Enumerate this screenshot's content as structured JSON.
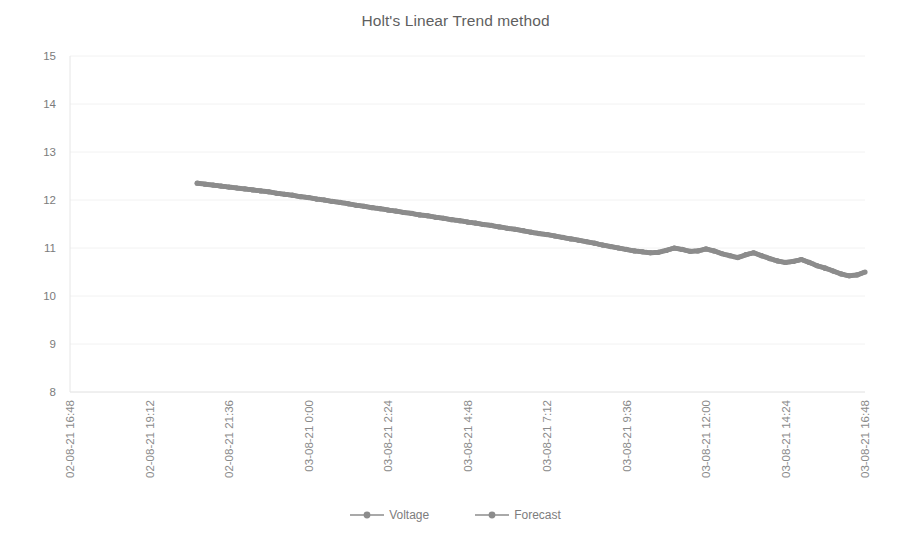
{
  "chart_data": {
    "type": "line",
    "title": "Holt's Linear Trend method",
    "xlabel": "",
    "ylabel": "",
    "ylim": [
      8,
      15
    ],
    "ytick_values": [
      8,
      9,
      10,
      11,
      12,
      13,
      14,
      15
    ],
    "ytick_labels": [
      "8",
      "9",
      "10",
      "11",
      "12",
      "13",
      "14",
      "15"
    ],
    "xtick_labels": [
      "02-08-21 16:48",
      "02-08-21 19:12",
      "02-08-21 21:36",
      "03-08-21 0:00",
      "03-08-21 2:24",
      "03-08-21 4:48",
      "03-08-21 7:12",
      "03-08-21 9:36",
      "03-08-21 12:00",
      "03-08-21 14:24",
      "03-08-21 16:48"
    ],
    "grid": true,
    "legend_position": "bottom",
    "series": [
      {
        "name": "Voltage",
        "color": "#8c8c8c",
        "marker": "circle",
        "x": [
          0.16,
          0.17,
          0.18,
          0.19,
          0.2,
          0.21,
          0.22,
          0.23,
          0.24,
          0.25,
          0.26,
          0.27,
          0.28,
          0.29,
          0.3,
          0.31,
          0.32,
          0.33,
          0.34,
          0.35,
          0.36,
          0.37,
          0.38,
          0.39,
          0.4,
          0.41,
          0.42,
          0.43,
          0.44,
          0.45,
          0.46,
          0.47,
          0.48,
          0.49,
          0.5,
          0.51,
          0.52,
          0.53,
          0.54,
          0.55,
          0.56,
          0.57,
          0.58,
          0.59,
          0.6,
          0.61,
          0.62,
          0.63,
          0.64,
          0.65,
          0.66,
          0.67,
          0.68,
          0.69,
          0.7,
          0.71,
          0.72,
          0.73,
          0.74,
          0.75,
          0.76,
          0.77,
          0.78,
          0.79,
          0.8,
          0.81,
          0.82,
          0.83,
          0.84,
          0.85,
          0.86,
          0.87,
          0.88,
          0.89,
          0.9,
          0.91,
          0.92,
          0.93,
          0.94,
          0.95
        ],
        "values": [
          12.35,
          12.33,
          12.31,
          12.29,
          12.27,
          12.25,
          12.23,
          12.21,
          12.19,
          12.17,
          12.14,
          12.12,
          12.1,
          12.07,
          12.05,
          12.02,
          12.0,
          11.97,
          11.95,
          11.92,
          11.89,
          11.87,
          11.84,
          11.82,
          11.79,
          11.77,
          11.74,
          11.72,
          11.69,
          11.67,
          11.64,
          11.62,
          11.59,
          11.57,
          11.54,
          11.52,
          11.49,
          11.47,
          11.44,
          11.41,
          11.39,
          11.36,
          11.33,
          11.3,
          11.28,
          11.25,
          11.22,
          11.19,
          11.16,
          11.13,
          11.1,
          11.06,
          11.03,
          11.0,
          10.97,
          10.94,
          10.92,
          10.9,
          10.91,
          10.95,
          11.0,
          10.97,
          10.93,
          10.94,
          10.98,
          10.94,
          10.88,
          10.84,
          10.8,
          10.86,
          10.9,
          10.84,
          10.78,
          10.73,
          10.7,
          10.72,
          10.76,
          10.7,
          10.63,
          10.58
        ]
      },
      {
        "name": "Forecast",
        "color": "#8c8c8c",
        "marker": "circle",
        "x": [
          0.95,
          0.96,
          0.97,
          0.98,
          0.99,
          1.0
        ],
        "values": [
          10.58,
          10.52,
          10.46,
          10.42,
          10.44,
          10.5
        ]
      }
    ],
    "annotations": []
  },
  "legend": {
    "items": [
      {
        "label": "Voltage",
        "color": "#8c8c8c"
      },
      {
        "label": "Forecast",
        "color": "#8c8c8c"
      }
    ]
  }
}
